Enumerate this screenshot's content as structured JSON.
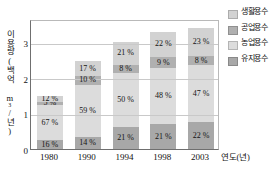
{
  "chart_data": {
    "type": "bar",
    "subtype": "stacked-bar",
    "title": "",
    "xlabel": "연도(년)",
    "ylabel": "이용량(백억 m³/년)",
    "categories": [
      "1980",
      "1990",
      "1994",
      "1998",
      "2003"
    ],
    "ylim": [
      0,
      3.65
    ],
    "yticks": [
      0,
      1,
      2,
      3
    ],
    "ytick_labels": [
      "0",
      "1",
      "2",
      "3"
    ],
    "grid": true,
    "legend_position": "right",
    "value_suffix": " %",
    "totals": [
      1.5,
      2.47,
      3.0,
      3.3,
      3.4
    ],
    "series": [
      {
        "name": "생활용수",
        "color": "#d2d2d2",
        "values": [
          12,
          17,
          21,
          22,
          23
        ],
        "labels": [
          "12 %",
          "17 %",
          "21 %",
          "22 %",
          "23 %"
        ]
      },
      {
        "name": "공업용수",
        "color": "#b0b0b0",
        "values": [
          5,
          10,
          8,
          9,
          8
        ],
        "labels": [
          "5 %",
          "10 %",
          "8 %",
          "9 %",
          "8 %"
        ]
      },
      {
        "name": "농업용수",
        "color": "#dcdcdc",
        "values": [
          67,
          59,
          50,
          48,
          47
        ],
        "labels": [
          "67 %",
          "59 %",
          "50 %",
          "48 %",
          "47 %"
        ]
      },
      {
        "name": "유지용수",
        "color": "#a8a8a8",
        "values": [
          16,
          14,
          21,
          21,
          22
        ],
        "labels": [
          "16 %",
          "14 %",
          "21 %",
          "21 %",
          "22 %"
        ]
      }
    ]
  },
  "axes": {
    "y_title_main": "이용량(백억 m",
    "y_title_sup": "3",
    "y_title_tail": "/년)",
    "x_title": "연도(년)",
    "ytick_0": "0",
    "ytick_1": "1",
    "ytick_2": "2",
    "ytick_3": "3",
    "xlabel_0": "1980",
    "xlabel_1": "1990",
    "xlabel_2": "1994",
    "xlabel_3": "1998",
    "xlabel_4": "2003"
  },
  "legend": {
    "items": [
      {
        "label": "생활용수",
        "color": "#d2d2d2"
      },
      {
        "label": "공업용수",
        "color": "#b0b0b0"
      },
      {
        "label": "농업용수",
        "color": "#dcdcdc"
      },
      {
        "label": "유지용수",
        "color": "#a8a8a8"
      }
    ]
  }
}
